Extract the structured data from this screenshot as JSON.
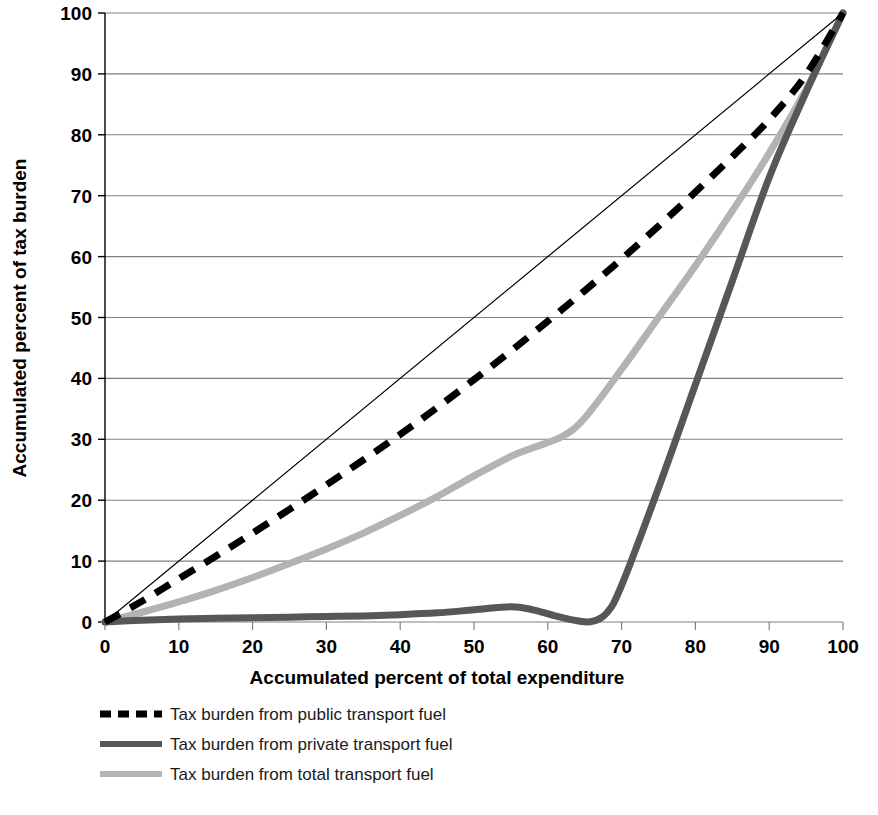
{
  "chart_data": {
    "type": "line",
    "title": "",
    "subtitle": "",
    "xlabel": "Accumulated percent of total expenditure",
    "ylabel": "Accumulated percent of tax burden",
    "xlim": [
      0,
      100
    ],
    "ylim": [
      0,
      100
    ],
    "xticks": [
      0,
      10,
      20,
      30,
      40,
      50,
      60,
      70,
      80,
      90,
      100
    ],
    "yticks": [
      0,
      10,
      20,
      30,
      40,
      50,
      60,
      70,
      80,
      90,
      100
    ],
    "xtick_labels": [
      "0",
      "10",
      "20",
      "30",
      "40",
      "50",
      "60",
      "70",
      "80",
      "90",
      "100"
    ],
    "ytick_labels": [
      "0",
      "10",
      "20",
      "30",
      "40",
      "50",
      "60",
      "70",
      "80",
      "90",
      "100"
    ],
    "grid": "horizontal",
    "legend_position": "bottom-left",
    "series": [
      {
        "name": "equality-line",
        "label": "",
        "style": "solid",
        "color": "#000000",
        "width": 1.2,
        "in_legend": false,
        "x": [
          0,
          100
        ],
        "y": [
          0,
          100
        ]
      },
      {
        "name": "public-transport-fuel",
        "label": "Tax burden from public transport fuel",
        "style": "dashed",
        "color": "#000000",
        "width": 7,
        "in_legend": true,
        "x": [
          0,
          5,
          10,
          15,
          20,
          25,
          30,
          35,
          40,
          45,
          50,
          55,
          60,
          65,
          70,
          75,
          80,
          85,
          90,
          95,
          100
        ],
        "y": [
          0,
          3.4,
          7.1,
          10.8,
          14.6,
          18.5,
          22.5,
          26.6,
          30.8,
          35.2,
          39.8,
          44.5,
          49.4,
          54.4,
          59.6,
          65.0,
          70.6,
          76.4,
          82.5,
          89.9,
          100
        ]
      },
      {
        "name": "private-transport-fuel",
        "label": "Tax burden from private transport fuel",
        "style": "solid",
        "color": "#575757",
        "width": 7,
        "in_legend": true,
        "x": [
          0,
          5,
          10,
          15,
          20,
          25,
          30,
          35,
          40,
          45,
          50,
          55,
          58,
          61,
          64,
          66,
          68,
          70,
          75,
          80,
          85,
          90,
          95,
          100
        ],
        "y": [
          0,
          0.3,
          0.5,
          0.6,
          0.7,
          0.8,
          0.9,
          1.0,
          1.2,
          1.5,
          2.0,
          2.5,
          2.0,
          1.0,
          0.2,
          0.1,
          1.5,
          6.0,
          22.0,
          39.0,
          56.0,
          73.0,
          87.0,
          100
        ]
      },
      {
        "name": "total-transport-fuel",
        "label": "Tax burden from total transport fuel",
        "style": "solid",
        "color": "#b3b3b3",
        "width": 7,
        "in_legend": true,
        "x": [
          0,
          5,
          10,
          15,
          20,
          25,
          30,
          35,
          40,
          45,
          50,
          55,
          58,
          62,
          65,
          70,
          75,
          80,
          85,
          90,
          95,
          100
        ],
        "y": [
          0,
          1.6,
          3.3,
          5.2,
          7.3,
          9.6,
          12.0,
          14.6,
          17.5,
          20.6,
          24.0,
          27.2,
          28.6,
          30.5,
          33.5,
          41.5,
          50.0,
          58.5,
          67.5,
          77.0,
          87.5,
          100
        ]
      }
    ],
    "legend": [
      {
        "label": "Tax burden from public transport fuel",
        "style": "dashed",
        "color": "#000000"
      },
      {
        "label": "Tax burden from private transport fuel",
        "style": "solid",
        "color": "#575757"
      },
      {
        "label": "Tax burden from total transport fuel",
        "style": "solid",
        "color": "#b3b3b3"
      }
    ],
    "colors": {
      "axis": "#000000",
      "grid": "#808080",
      "public": "#000000",
      "private": "#575757",
      "total": "#b3b3b3",
      "background": "#ffffff"
    }
  }
}
